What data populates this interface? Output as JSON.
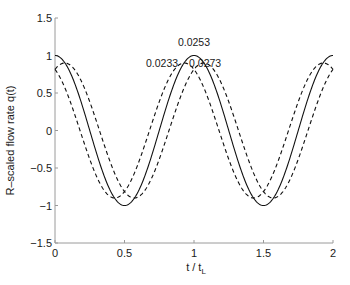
{
  "chart_data": {
    "type": "line",
    "title": "",
    "xlabel": "t / t",
    "xlabel_subscript": "L",
    "ylabel": "R–scaled flow rate q(t)",
    "xlim": [
      0,
      2
    ],
    "ylim": [
      -1.5,
      1.5
    ],
    "xticks": [
      0,
      0.5,
      1,
      1.5,
      2
    ],
    "xtick_labels": [
      "0",
      "0.5",
      "1",
      "1.5",
      "2"
    ],
    "yticks": [
      -1.5,
      -1,
      -0.5,
      0,
      0.5,
      1,
      1.5
    ],
    "ytick_labels": [
      "−1.5",
      "−1",
      "−0.5",
      "0",
      "0.5",
      "1",
      "1.5"
    ],
    "grid": false,
    "series": [
      {
        "name": "0.0253",
        "style": "solid",
        "amplitude": 1.0,
        "period": 1.0,
        "phase_shift": 0.0,
        "function": "amplitude*cos(2*pi*(t - phase_shift)/period)"
      },
      {
        "name": "0.0233",
        "style": "dashed",
        "amplitude": 0.9,
        "period": 1.0,
        "phase_shift": -0.07,
        "function": "amplitude*cos(2*pi*(t - phase_shift)/period)"
      },
      {
        "name": "0.0273",
        "style": "dashed",
        "amplitude": 0.9,
        "period": 1.0,
        "phase_shift": 0.07,
        "function": "amplitude*cos(2*pi*(t - phase_shift)/period)"
      }
    ],
    "annotations": [
      {
        "text": "0.0253",
        "x": 1.0,
        "y": 1.13
      },
      {
        "text": "0.0233",
        "x": 0.77,
        "y": 0.85
      },
      {
        "text": "0.0273",
        "x": 1.08,
        "y": 0.85
      }
    ]
  }
}
